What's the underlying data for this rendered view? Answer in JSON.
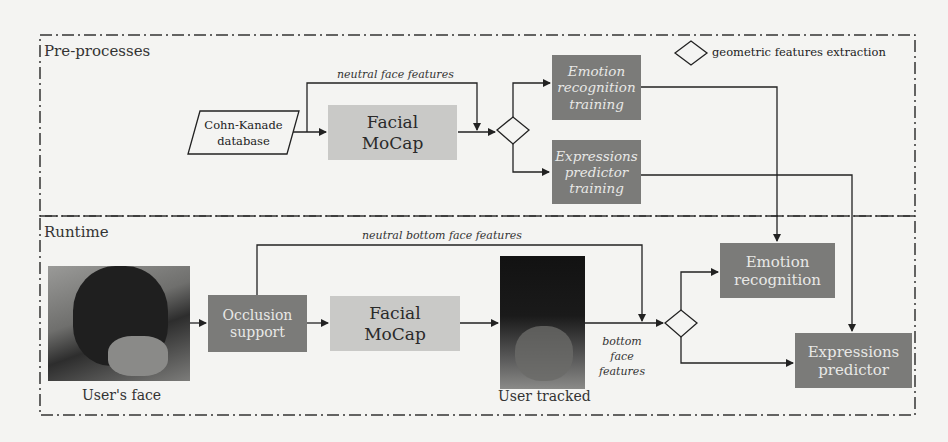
{
  "sections": {
    "preprocess_label": "Pre-processes",
    "runtime_label": "Runtime"
  },
  "legend": {
    "symbol": "diamond",
    "text": "geometric features extraction"
  },
  "preprocess": {
    "database": "Cohn-Kanade database",
    "database_line1": "Cohn-Kanade",
    "database_line2": "database",
    "mocap_line1": "Facial",
    "mocap_line2": "MoCap",
    "neutral_features_label": "neutral face features",
    "emotion_training_line1": "Emotion",
    "emotion_training_line2": "recognition",
    "emotion_training_line3": "training",
    "expr_training_line1": "Expressions",
    "expr_training_line2": "predictor",
    "expr_training_line3": "training"
  },
  "runtime": {
    "user_face_caption": "User's face",
    "occlusion_line1": "Occlusion",
    "occlusion_line2": "support",
    "mocap_line1": "Facial",
    "mocap_line2": "MoCap",
    "neutral_bottom_label": "neutral bottom face features",
    "user_tracked_caption": "User tracked",
    "bottom_features_line1": "bottom",
    "bottom_features_line2": "face",
    "bottom_features_line3": "features",
    "emotion_line1": "Emotion",
    "emotion_line2": "recognition",
    "expr_line1": "Expressions",
    "expr_line2": "predictor"
  },
  "colors": {
    "light_box": "#c9c9c7",
    "dark_box": "#7b7b79",
    "line": "#222222",
    "background": "#f4f4f2"
  }
}
